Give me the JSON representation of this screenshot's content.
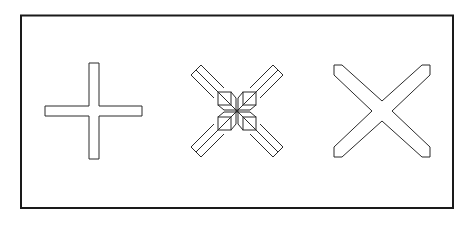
{
  "figure": {
    "frame": {
      "x": 21,
      "y": 15,
      "width": 432,
      "height": 193,
      "stroke": "#1a1a1a"
    },
    "shapes": [
      {
        "id": "plus-cross",
        "label": "Plus-shaped cross (upright)",
        "cx": 94,
        "cy": 111
      },
      {
        "id": "faceted-x",
        "label": "Faceted diagonal X with center squares",
        "cx": 237,
        "cy": 111
      },
      {
        "id": "beveled-x",
        "label": "Diagonal X with beveled ends",
        "cx": 382,
        "cy": 111
      }
    ],
    "colors": {
      "line": "#2a2a2a",
      "background": "#ffffff"
    }
  }
}
